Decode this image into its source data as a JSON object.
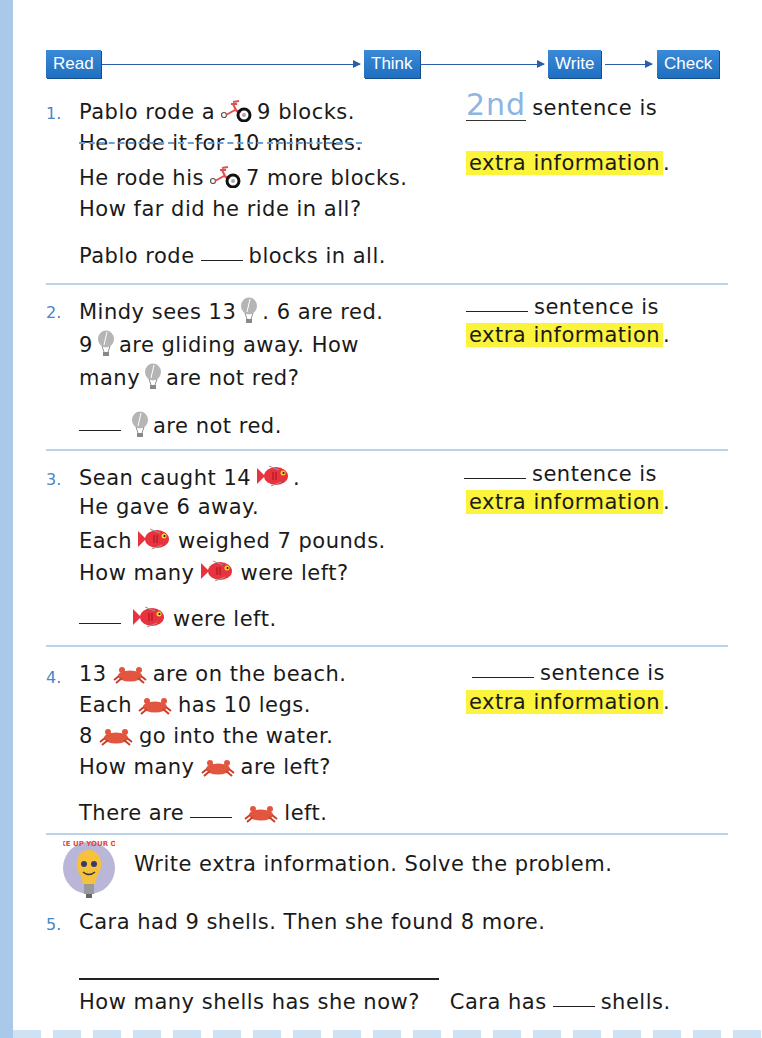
{
  "flow": {
    "steps": [
      "Read",
      "Think",
      "Write",
      "Check"
    ],
    "color": "#2a7bcc"
  },
  "problems": [
    {
      "number": "1.",
      "lines": [
        {
          "parts": [
            "Pablo rode a",
            "bicycle",
            "9 blocks."
          ]
        },
        {
          "text": "He rode it for 10 minutes.",
          "struck": true
        },
        {
          "parts": [
            "He rode his",
            "bicycle",
            "7 more blocks."
          ]
        },
        {
          "text": "How far did he ride in all?"
        }
      ],
      "answer": {
        "before": "Pablo rode",
        "after": "blocks in all."
      },
      "side": {
        "filled": "2nd",
        "suffix": "sentence is",
        "highlight": "extra information",
        "period": "."
      }
    },
    {
      "number": "2.",
      "lines": [
        {
          "parts": [
            "Mindy sees 13",
            "balloon",
            ". 6 are red."
          ]
        },
        {
          "parts": [
            "9",
            "balloon",
            "are gliding away. How"
          ]
        },
        {
          "parts": [
            "many",
            "balloon",
            "are not red?"
          ]
        }
      ],
      "answer": {
        "before": "",
        "icon": "balloon",
        "after": "are not red."
      },
      "side": {
        "filled": "",
        "suffix": "sentence is",
        "highlight": "extra information",
        "period": "."
      }
    },
    {
      "number": "3.",
      "lines": [
        {
          "parts": [
            "Sean caught 14",
            "fish",
            "."
          ]
        },
        {
          "text": "He gave 6 away."
        },
        {
          "parts": [
            "Each",
            "fish",
            "weighed 7 pounds."
          ]
        },
        {
          "parts": [
            "How many",
            "fish",
            "were left?"
          ]
        }
      ],
      "answer": {
        "before": "",
        "icon": "fish",
        "after": "were left."
      },
      "side": {
        "filled": "",
        "suffix": "sentence is",
        "highlight": "extra information",
        "period": "."
      }
    },
    {
      "number": "4.",
      "lines": [
        {
          "parts": [
            "13",
            "crab",
            "are on the beach."
          ]
        },
        {
          "parts": [
            "Each",
            "crab",
            "has 10 legs."
          ]
        },
        {
          "parts": [
            "8",
            "crab",
            "go into the water."
          ]
        },
        {
          "parts": [
            "How many",
            "crab",
            "are left?"
          ]
        }
      ],
      "answer": {
        "before": "There are",
        "icon": "crab",
        "after": "left."
      },
      "side": {
        "filled": "",
        "suffix": "sentence is",
        "highlight": "extra information",
        "period": "."
      }
    }
  ],
  "make_your_own": {
    "badge_text": "MAKE UP YOUR OWN",
    "instruction": "Write extra information. Solve the problem.",
    "number": "5.",
    "statement": "Cara had 9 shells. Then she found 8 more.",
    "question": "How many shells has she now?",
    "answer_before": "Cara has",
    "answer_after": "shells."
  },
  "colors": {
    "highlight": "#fbf33c",
    "number": "#4a86c5",
    "separator": "#b9d3ec",
    "traced": "#8cb5e2"
  }
}
